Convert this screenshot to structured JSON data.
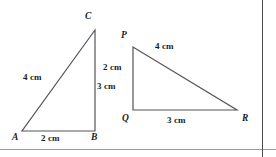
{
  "figure": {
    "background_color": "#ffffff",
    "stroke_color": "#55545a",
    "text_color": "#1a1a1a",
    "triangles": [
      {
        "name": "triangle-abc",
        "vertices": [
          {
            "label": "A",
            "x": 22,
            "y": 131,
            "label_x": 12,
            "label_y": 133
          },
          {
            "label": "B",
            "x": 95,
            "y": 131,
            "label_x": 91,
            "label_y": 133
          },
          {
            "label": "C",
            "x": 95,
            "y": 30,
            "label_x": 85,
            "label_y": 12
          }
        ],
        "sides": [
          {
            "name": "side-ac",
            "length": "4 cm",
            "label_x": 23,
            "label_y": 73
          },
          {
            "name": "side-cb",
            "length": "3 cm",
            "label_x": 97,
            "label_y": 82
          },
          {
            "name": "side-ab",
            "length": "2 cm",
            "label_x": 41,
            "label_y": 134
          }
        ]
      },
      {
        "name": "triangle-pqr",
        "vertices": [
          {
            "label": "P",
            "x": 133,
            "y": 47,
            "label_x": 121,
            "label_y": 31
          },
          {
            "label": "Q",
            "x": 133,
            "y": 110,
            "label_x": 122,
            "label_y": 114
          },
          {
            "label": "R",
            "x": 237,
            "y": 110,
            "label_x": 242,
            "label_y": 114
          }
        ],
        "sides": [
          {
            "name": "side-pq",
            "length": "2 cm",
            "label_x": 103,
            "label_y": 63
          },
          {
            "name": "side-pr",
            "length": "4 cm",
            "label_x": 155,
            "label_y": 42
          },
          {
            "name": "side-qr",
            "length": "3 cm",
            "label_x": 167,
            "label_y": 116
          }
        ]
      }
    ],
    "rules": {
      "bottom_rule_color": "#9a9a9a",
      "right_rule_color": "#4a4a4a"
    }
  }
}
